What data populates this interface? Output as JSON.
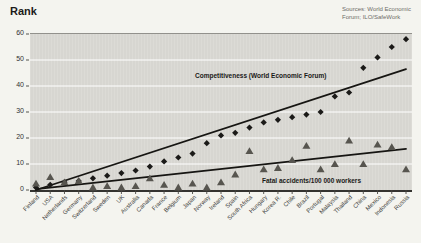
{
  "page": {
    "title": "Rank",
    "sources": [
      "Sources: World Economic",
      "Forum; ILO/SafeWork"
    ]
  },
  "chart_data": {
    "type": "scatter",
    "title": "Rank",
    "ylabel": "Rank",
    "xlabel": "",
    "ylim": [
      0,
      60
    ],
    "yticks": [
      0,
      10,
      20,
      30,
      40,
      50,
      60
    ],
    "grid": "horizontal white gridlines on gray plot background",
    "legend_position": "inline text annotations on plot",
    "categories": [
      "Finland",
      "USA",
      "Netherlands",
      "Germany",
      "Switzerland",
      "Sweden",
      "UK",
      "Australia",
      "Canada",
      "France",
      "Belgium",
      "Japan",
      "Norway",
      "Ireland",
      "Spain",
      "South Africa",
      "Hungary",
      "Korea R.",
      "Chile",
      "Brazil",
      "Portugal",
      "Malaysia",
      "Thailand",
      "China",
      "Mexico",
      "Indonesia",
      "Russia"
    ],
    "series": [
      {
        "name": "Competitiveness (World Economic Forum)",
        "marker": "diamond",
        "color": "#1b1a18",
        "values": [
          1,
          2,
          3,
          3.5,
          4.5,
          5.5,
          6.5,
          7.5,
          9,
          11,
          12.5,
          14,
          18,
          21,
          22,
          24,
          26,
          27,
          28,
          29,
          30,
          36,
          37.5,
          47,
          51,
          55,
          58
        ]
      },
      {
        "name": "Fatal accidents/100 000 workers",
        "marker": "triangle",
        "color": "#57554f",
        "values": [
          2.5,
          5,
          3,
          3.5,
          1,
          1.5,
          1,
          1.5,
          4.5,
          2,
          1,
          2.5,
          1,
          3,
          6,
          15,
          8,
          8.5,
          11.5,
          17,
          8,
          10,
          19,
          10,
          17.5,
          16.5,
          8
        ]
      }
    ],
    "trend_lines": [
      {
        "series": "competitiveness",
        "from": [
          0,
          0
        ],
        "to": [
          26,
          46.5
        ]
      },
      {
        "series": "fatal-accidents",
        "from": [
          0,
          0.3
        ],
        "to": [
          26,
          15.8
        ]
      }
    ],
    "colors": {
      "plot_bg": "#d9d8d3",
      "page_bg": "#f4f4ef",
      "gridline": "#ffffff",
      "axis": "#343330",
      "trend": "#161512"
    }
  }
}
